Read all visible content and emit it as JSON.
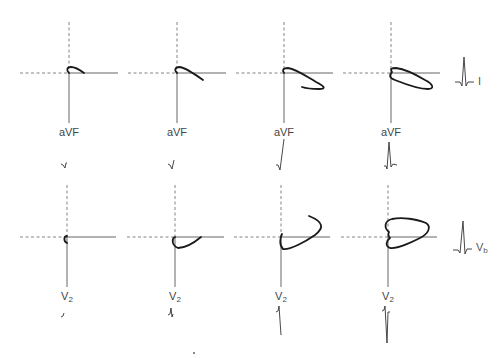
{
  "figure": {
    "colors": {
      "loop": "#1a1a1a",
      "axis": "#555555",
      "dashed": "#777777",
      "label": "#444444"
    }
  },
  "rows": [
    {
      "id": "frontal",
      "vertical_axis_label": "aVF",
      "side_lead": {
        "label": "I",
        "subscript": ""
      },
      "panels": [
        {
          "index": 1,
          "axis_label": "aVF",
          "loop": "small-clockwise-tail"
        },
        {
          "index": 2,
          "axis_label": "aVF",
          "loop": "extended-tail-down-right"
        },
        {
          "index": 3,
          "axis_label": "aVF",
          "loop": "open-loop-down-right"
        },
        {
          "index": 4,
          "axis_label": "aVF",
          "loop": "closed-elongated-loop"
        }
      ]
    },
    {
      "id": "horizontal",
      "vertical_axis_label": "V",
      "vertical_axis_sub": "2",
      "side_lead": {
        "label": "V",
        "subscript": "b"
      },
      "panels": [
        {
          "index": 1,
          "axis_label": "V",
          "axis_sub": "2",
          "loop": "tiny-hook"
        },
        {
          "index": 2,
          "axis_label": "V",
          "axis_sub": "2",
          "loop": "small-anterior-loop"
        },
        {
          "index": 3,
          "axis_label": "V",
          "axis_sub": "2",
          "loop": "open-loop-up-right"
        },
        {
          "index": 4,
          "axis_label": "V",
          "axis_sub": "2",
          "loop": "closed-heart-shaped-loop"
        }
      ]
    }
  ]
}
